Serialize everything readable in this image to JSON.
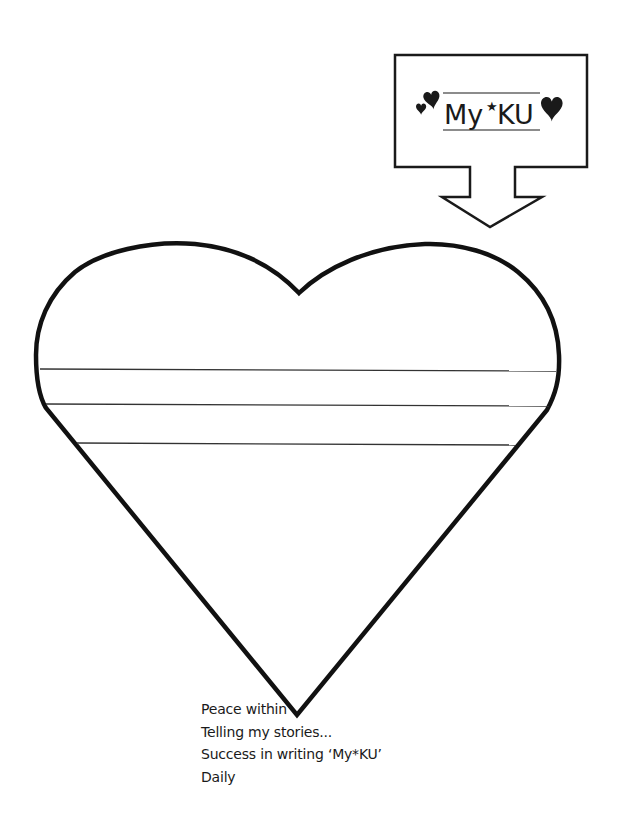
{
  "label_box": {
    "title_prefix": "My",
    "title_star": "★",
    "title_suffix": "KU",
    "decoration": [
      "small-heart",
      "medium-heart",
      "large-heart"
    ]
  },
  "heart": {
    "writing_lines": 3,
    "stroke_color": "#111111",
    "line_color": "#333333"
  },
  "caption": {
    "lines": [
      "Peace within",
      "Telling my stories...",
      "Success in writing ‘My*KU’",
      "Daily"
    ]
  }
}
